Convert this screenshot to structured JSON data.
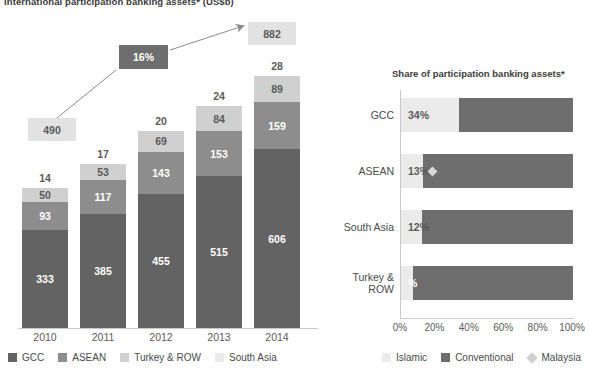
{
  "left": {
    "title": "International participation banking assets* (US$b)",
    "callout_start": "490",
    "callout_end": "882",
    "cagr_label": "16%",
    "legend": [
      {
        "label": "GCC",
        "color": "#636363"
      },
      {
        "label": "ASEAN",
        "color": "#8d8d8d"
      },
      {
        "label": "Turkey & ROW",
        "color": "#d0d0d0"
      },
      {
        "label": "South Asia",
        "color": "#ebebeb"
      }
    ]
  },
  "right": {
    "title": "Share of participation banking assets*",
    "legend": [
      {
        "label": "Islamic",
        "color": "#ebebeb",
        "shape": "square"
      },
      {
        "label": "Conventional",
        "color": "#6e6e6e",
        "shape": "square"
      },
      {
        "label": "Malaysia",
        "color": "#d0d0d0",
        "shape": "diamond"
      }
    ]
  },
  "chart_data": [
    {
      "type": "bar",
      "title": "International participation banking assets* (US$b)",
      "xlabel": "",
      "ylabel": "US$b",
      "stacked": true,
      "categories": [
        "2010",
        "2011",
        "2012",
        "2013",
        "2014"
      ],
      "series": [
        {
          "name": "GCC",
          "color": "#636363",
          "values": [
            333,
            385,
            455,
            515,
            606
          ]
        },
        {
          "name": "ASEAN",
          "color": "#8d8d8d",
          "values": [
            93,
            117,
            143,
            153,
            159
          ]
        },
        {
          "name": "Turkey & ROW",
          "color": "#d0d0d0",
          "values": [
            50,
            53,
            69,
            84,
            89
          ]
        },
        {
          "name": "South Asia",
          "color": "#ebebeb",
          "values": [
            14,
            17,
            20,
            24,
            28
          ]
        }
      ],
      "totals": [
        490,
        572,
        687,
        776,
        882
      ],
      "annotations": [
        {
          "text": "490",
          "kind": "start-total"
        },
        {
          "text": "882",
          "kind": "end-total"
        },
        {
          "text": "16%",
          "kind": "cagr-arrow"
        }
      ],
      "legend_position": "bottom",
      "grid": false
    },
    {
      "type": "bar",
      "orientation": "horizontal",
      "stacked": true,
      "title": "Share of participation banking assets*",
      "xlabel": "",
      "ylabel": "",
      "categories": [
        "GCC",
        "ASEAN",
        "South Asia",
        "Turkey & ROW"
      ],
      "series": [
        {
          "name": "Islamic",
          "color": "#ebebeb",
          "values": [
            34,
            13,
            12,
            7
          ]
        },
        {
          "name": "Conventional",
          "color": "#6e6e6e",
          "values": [
            66,
            87,
            88,
            93
          ]
        }
      ],
      "data_labels": [
        "34%",
        "13%",
        "12%",
        "%"
      ],
      "markers": [
        {
          "name": "Malaysia",
          "category": "ASEAN",
          "value": 16,
          "color": "#d0d0d0"
        }
      ],
      "xticks": [
        "0%",
        "20%",
        "40%",
        "60%",
        "80%",
        "100%"
      ],
      "xlim": [
        0,
        100
      ],
      "legend_position": "bottom",
      "grid": false
    }
  ]
}
